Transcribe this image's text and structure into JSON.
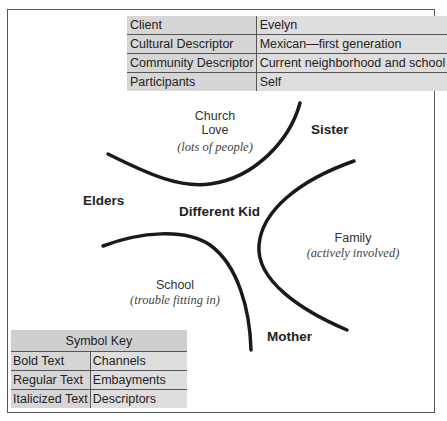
{
  "info_table": {
    "rows": [
      {
        "key": "Client",
        "value": "Evelyn"
      },
      {
        "key": "Cultural Descriptor",
        "value": "Mexican—first generation"
      },
      {
        "key": "Community Descriptor",
        "value": "Current neighborhood and school"
      },
      {
        "key": "Participants",
        "value": "Self"
      }
    ]
  },
  "map": {
    "center": "Different Kid",
    "channels": [
      "Sister",
      "Elders",
      "Mother"
    ],
    "embayments": [
      {
        "name": "Church",
        "name2": "Love",
        "descriptor": "(lots of people)"
      },
      {
        "name": "Family",
        "descriptor": "(actively involved)"
      },
      {
        "name": "School",
        "descriptor": "(trouble fitting in)"
      }
    ]
  },
  "symbol_key": {
    "title": "Symbol Key",
    "rows": [
      {
        "key": "Bold Text",
        "value": "Channels"
      },
      {
        "key": "Regular Text",
        "value": "Embayments"
      },
      {
        "key": "Italicized Text",
        "value": "Descriptors"
      }
    ]
  }
}
